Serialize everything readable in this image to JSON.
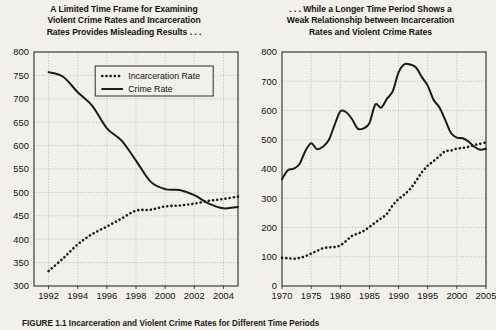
{
  "figure": {
    "caption": "FIGURE 1.1  Incarceration and Violent Crime Rates for Different Time Periods"
  },
  "panels": [
    {
      "id": "left",
      "title_lines": [
        "A Limited Time Frame for Examining",
        "Violent Crime Rates and Incarceration",
        "Rates Provides Misleading Results . . ."
      ],
      "legend": {
        "visible": true,
        "items": [
          {
            "label": "Incarceration Rate",
            "style": "dotted"
          },
          {
            "label": "Crime Rate",
            "style": "solid"
          }
        ]
      }
    },
    {
      "id": "right",
      "title_lines": [
        ". . . While a Longer Time Period Shows a",
        "Weak Relationship between Incarceration",
        "Rates and Violent Crime Rates"
      ],
      "legend": {
        "visible": false,
        "items": []
      }
    }
  ],
  "chart_data": [
    {
      "type": "line",
      "title": "A Limited Time Frame for Examining Violent Crime Rates and Incarceration Rates Provides Misleading Results . . .",
      "xlabel": "",
      "ylabel": "",
      "xlim": [
        1991,
        2005
      ],
      "ylim": [
        300,
        800
      ],
      "yticks": [
        300,
        350,
        400,
        450,
        500,
        550,
        600,
        650,
        700,
        750,
        800
      ],
      "xticks": [
        1992,
        1994,
        1996,
        1998,
        2000,
        2002,
        2004
      ],
      "grid": true,
      "legend_position": "upper-center",
      "x": [
        1992,
        1993,
        1994,
        1995,
        1996,
        1997,
        1998,
        1999,
        2000,
        2001,
        2002,
        2003,
        2004,
        2005
      ],
      "series": [
        {
          "name": "Crime Rate",
          "style": "solid",
          "color": "#1a1a1a",
          "values": [
            757,
            747,
            714,
            685,
            637,
            611,
            568,
            523,
            507,
            505,
            494,
            476,
            466,
            469
          ]
        },
        {
          "name": "Incarceration Rate",
          "style": "dotted",
          "color": "#1a1a1a",
          "values": [
            332,
            359,
            389,
            411,
            427,
            444,
            461,
            463,
            470,
            472,
            476,
            482,
            486,
            491
          ]
        }
      ]
    },
    {
      "type": "line",
      "title": ". . . While a Longer Time Period Shows a Weak Relationship between Incarceration Rates and Violent Crime Rates",
      "xlabel": "",
      "ylabel": "",
      "xlim": [
        1970,
        2005
      ],
      "ylim": [
        0,
        800
      ],
      "yticks": [
        0,
        100,
        200,
        300,
        400,
        500,
        600,
        700,
        800
      ],
      "xticks": [
        1970,
        1975,
        1980,
        1985,
        1990,
        1995,
        2000,
        2005
      ],
      "grid": true,
      "legend_position": "none",
      "x": [
        1970,
        1971,
        1972,
        1973,
        1974,
        1975,
        1976,
        1977,
        1978,
        1979,
        1980,
        1981,
        1982,
        1983,
        1984,
        1985,
        1986,
        1987,
        1988,
        1989,
        1990,
        1991,
        1992,
        1993,
        1994,
        1995,
        1996,
        1997,
        1998,
        1999,
        2000,
        2001,
        2002,
        2003,
        2004,
        2005
      ],
      "series": [
        {
          "name": "Crime Rate",
          "style": "solid",
          "color": "#1a1a1a",
          "values": [
            365,
            396,
            401,
            417,
            461,
            488,
            468,
            476,
            498,
            549,
            597,
            594,
            571,
            538,
            539,
            557,
            620,
            610,
            640,
            666,
            730,
            758,
            757,
            747,
            714,
            685,
            637,
            611,
            568,
            523,
            507,
            505,
            494,
            476,
            466,
            469
          ]
        },
        {
          "name": "Incarceration Rate",
          "style": "dotted",
          "color": "#1a1a1a",
          "values": [
            96,
            95,
            93,
            96,
            102,
            111,
            120,
            129,
            132,
            133,
            139,
            154,
            171,
            179,
            188,
            202,
            217,
            231,
            247,
            276,
            297,
            313,
            332,
            359,
            389,
            411,
            427,
            444,
            461,
            463,
            470,
            472,
            476,
            482,
            486,
            491
          ]
        }
      ]
    }
  ]
}
